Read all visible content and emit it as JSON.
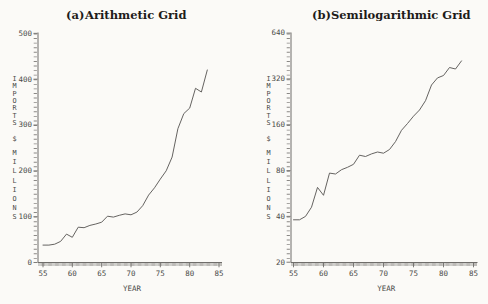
{
  "page": {
    "background": "#fbfaf7",
    "text_color": "#4a4a48",
    "line_color": "#5d5b58",
    "axis_color": "#6f6d6a"
  },
  "chart_data": [
    {
      "type": "line",
      "panel": "a",
      "title_prefix": "(a)",
      "title": "Arithmetic Grid",
      "xlabel": "YEAR",
      "ylabel_words": [
        "IMPORTS",
        "$",
        "MILLIONS"
      ],
      "series_name": "Imports ($ millions)",
      "y_scale": "linear",
      "ylim": [
        0,
        500
      ],
      "xlim": [
        55,
        85
      ],
      "grid": "none",
      "legend": "none",
      "yticks": [
        500,
        400,
        300,
        200,
        100,
        0
      ],
      "xticks": [
        55,
        60,
        65,
        70,
        75,
        80,
        85
      ],
      "x": [
        55,
        56,
        57,
        58,
        59,
        60,
        61,
        62,
        63,
        64,
        65,
        66,
        67,
        68,
        69,
        70,
        71,
        72,
        73,
        74,
        75,
        76,
        77,
        78,
        79,
        80,
        81,
        82,
        83
      ],
      "values": [
        38,
        38,
        40,
        46,
        62,
        55,
        77,
        76,
        81,
        84,
        88,
        101,
        99,
        103,
        106,
        104,
        110,
        124,
        147,
        163,
        182,
        200,
        230,
        292,
        325,
        337,
        380,
        372,
        420
      ]
    },
    {
      "type": "line",
      "panel": "b",
      "title_prefix": "(b)",
      "title": "Semilogarithmic Grid",
      "xlabel": "YEAR",
      "ylabel_words": [
        "IMPORTS",
        "$",
        "MILLIONS"
      ],
      "series_name": "Imports ($ millions)",
      "y_scale": "log2",
      "ylim": [
        20,
        640
      ],
      "xlim": [
        55,
        85
      ],
      "grid": "none",
      "legend": "none",
      "yticks": [
        640,
        320,
        160,
        80,
        40,
        20
      ],
      "xticks": [
        55,
        60,
        65,
        70,
        75,
        80,
        85
      ],
      "x": [
        55,
        56,
        57,
        58,
        59,
        60,
        61,
        62,
        63,
        64,
        65,
        66,
        67,
        68,
        69,
        70,
        71,
        72,
        73,
        74,
        75,
        76,
        77,
        78,
        79,
        80,
        81,
        82,
        83
      ],
      "values": [
        38,
        38,
        40,
        46,
        62,
        55,
        77,
        76,
        81,
        84,
        88,
        101,
        99,
        103,
        106,
        104,
        110,
        124,
        147,
        163,
        182,
        200,
        230,
        292,
        325,
        337,
        380,
        372,
        420
      ]
    }
  ]
}
